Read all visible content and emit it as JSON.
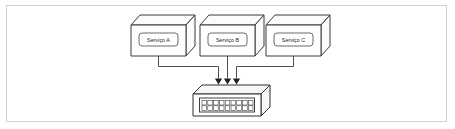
{
  "diagram": {
    "title": "Servicos conectados a um switch de rede",
    "colors": {
      "frame_border": "#d2d2d2",
      "background": "#ffffff",
      "node_stroke": "#3b3b3b",
      "node_fill": "#ffffff",
      "connector": "#3b3b3b",
      "arrow": "#222222",
      "label_text": "#1d1d1d"
    },
    "nodes": [
      {
        "id": "service-a",
        "label": "Serviço A",
        "type": "service-box",
        "x": 130,
        "y": 14
      },
      {
        "id": "service-b",
        "label": "Serviço B",
        "type": "service-box",
        "x": 199,
        "y": 14
      },
      {
        "id": "service-c",
        "label": "Serviço C",
        "type": "service-box",
        "x": 265,
        "y": 14
      }
    ],
    "device": {
      "id": "network-switch",
      "type": "switch",
      "label": "",
      "port_rows": 2,
      "port_columns": 9,
      "x": 191,
      "y": 84
    },
    "connections": [
      {
        "from": "service-a",
        "to": "network-switch",
        "arrow": "down",
        "routing": "down-right-down"
      },
      {
        "from": "service-b",
        "to": "network-switch",
        "arrow": "down",
        "routing": "straight-down"
      },
      {
        "from": "service-c",
        "to": "network-switch",
        "arrow": "down",
        "routing": "down-left-down"
      }
    ]
  }
}
